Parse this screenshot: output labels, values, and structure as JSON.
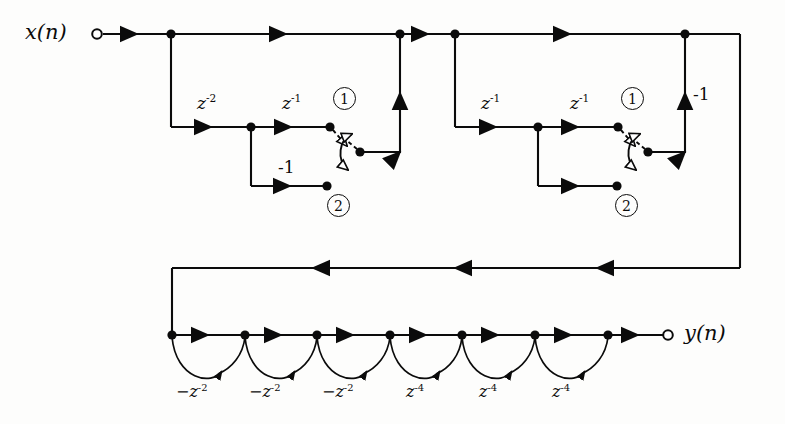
{
  "figure": {
    "type": "signal-flow-graph",
    "background_color": "#fdfdfc",
    "line_color": "#0b0b0b"
  },
  "io": {
    "input_label": "x(n)",
    "input_var": "x",
    "input_arg": "(n)",
    "output_label": "y(n)",
    "output_var": "y",
    "output_arg": "(n)"
  },
  "stage1": {
    "delay_a": "z",
    "delay_a_exp": "-2",
    "delay_b": "z",
    "delay_b_exp": "-1",
    "gain_lower": "-1",
    "switch_pos_1": "1",
    "switch_pos_2": "2"
  },
  "stage2": {
    "delay_a": "z",
    "delay_a_exp": "-1",
    "delay_b": "z",
    "delay_b_exp": "-1",
    "gain_feedback": "-1",
    "switch_pos_1": "1",
    "switch_pos_2": "2"
  },
  "bottom_chain": {
    "arc_labels": [
      {
        "sign": "−",
        "base": "z",
        "exp": "-2"
      },
      {
        "sign": "−",
        "base": "z",
        "exp": "-2"
      },
      {
        "sign": "−",
        "base": "z",
        "exp": "-2"
      },
      {
        "sign": "",
        "base": "z",
        "exp": "-4"
      },
      {
        "sign": "",
        "base": "z",
        "exp": "-4"
      },
      {
        "sign": "",
        "base": "z",
        "exp": "-4"
      }
    ]
  }
}
